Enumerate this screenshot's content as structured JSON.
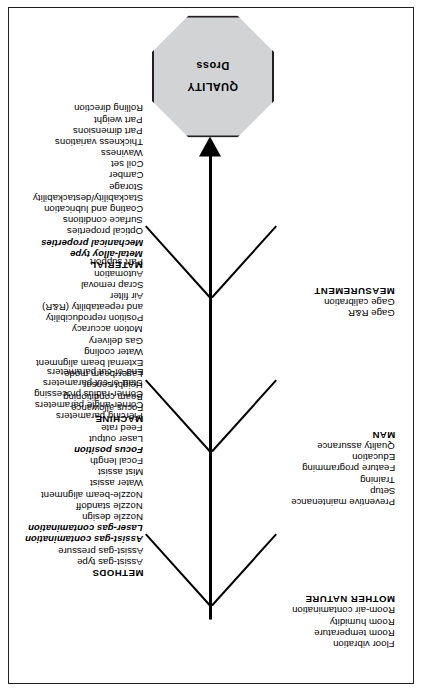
{
  "diagram": {
    "type": "fishbone-ishikawa",
    "orientation": "rotated-90-ccw",
    "effect": {
      "title": "QUALITY",
      "subtitle": "Dross",
      "shape": "octagon",
      "fill_color": "#d2d3d5",
      "border_color": "#231f20"
    },
    "categories": [
      {
        "name": "METHODS",
        "side": "lower",
        "items": [
          {
            "label": "METHODS",
            "style": "head"
          },
          {
            "label": "Assist-gas type",
            "style": "normal"
          },
          {
            "label": "Assist-gas pressure",
            "style": "normal"
          },
          {
            "label": "Assist-gas contamination",
            "style": "em"
          },
          {
            "label": "Laser-gas contamination",
            "style": "em"
          },
          {
            "label": "Nozzle design",
            "style": "normal"
          },
          {
            "label": "Nozzle standoff",
            "style": "normal"
          },
          {
            "label": "Nozzle-beam alignment",
            "style": "normal"
          },
          {
            "label": "Water assist",
            "style": "normal"
          },
          {
            "label": "Mist assist",
            "style": "normal"
          },
          {
            "label": "Focal length",
            "style": "normal"
          },
          {
            "label": "Focus position",
            "style": "em"
          },
          {
            "label": "Laser output",
            "style": "normal"
          },
          {
            "label": "Feed rate",
            "style": "normal"
          },
          {
            "label": "Piercing parameters",
            "style": "normal"
          },
          {
            "label": "Corner-angle parameters",
            "style": "normal"
          },
          {
            "label": "Corner-radius processing",
            "style": "normal"
          },
          {
            "label": "Start-of-cut parameters",
            "style": "normal"
          },
          {
            "label": "End-of-cut parameters",
            "style": "normal"
          }
        ]
      },
      {
        "name": "MOTHER NATURE",
        "side": "upper",
        "items": [
          {
            "label": "Floor vibration",
            "style": "normal"
          },
          {
            "label": "Room temperature",
            "style": "normal"
          },
          {
            "label": "Room humidity",
            "style": "normal"
          },
          {
            "label": "Room-air contamination",
            "style": "normal"
          },
          {
            "label": "MOTHER NATURE",
            "style": "head"
          }
        ]
      },
      {
        "name": "MACHINE",
        "side": "lower",
        "items": [
          {
            "label": "MACHINE",
            "style": "head"
          },
          {
            "label": "Focus allowance",
            "style": "normal"
          },
          {
            "label": "Beam conditioning",
            "style": "normal"
          },
          {
            "label": "Height sensor",
            "style": "normal"
          },
          {
            "label": "Laser-beam mode",
            "style": "normal"
          },
          {
            "label": "External beam alignment",
            "style": "normal"
          },
          {
            "label": "Water cooling",
            "style": "normal"
          },
          {
            "label": "Gas delivery",
            "style": "normal"
          },
          {
            "label": "Motion accuracy",
            "style": "normal"
          },
          {
            "label": "Position reproducibility",
            "style": "normal"
          },
          {
            "label": "and repeatability (R&R)",
            "style": "normal"
          },
          {
            "label": "Air filter",
            "style": "normal"
          },
          {
            "label": "Scrap removal",
            "style": "normal"
          },
          {
            "label": "Automation",
            "style": "normal"
          },
          {
            "label": "Part support",
            "style": "normal"
          }
        ]
      },
      {
        "name": "MAN",
        "side": "upper",
        "items": [
          {
            "label": "Preventive maintenance",
            "style": "normal"
          },
          {
            "label": "Setup",
            "style": "normal"
          },
          {
            "label": "Training",
            "style": "normal"
          },
          {
            "label": "Feature programming",
            "style": "normal"
          },
          {
            "label": "Education",
            "style": "normal"
          },
          {
            "label": "Quality assurance",
            "style": "normal"
          },
          {
            "label": "MAN",
            "style": "head"
          }
        ]
      },
      {
        "name": "MATERIAL",
        "side": "lower",
        "items": [
          {
            "label": "MATERIAL",
            "style": "head"
          },
          {
            "label": "Metal-alloy type",
            "style": "em"
          },
          {
            "label": "Mechanical properties",
            "style": "em"
          },
          {
            "label": "Optical properties",
            "style": "normal"
          },
          {
            "label": "Surface conditions",
            "style": "normal"
          },
          {
            "label": "Coating and lubrication",
            "style": "normal"
          },
          {
            "label": "Stackability/destackability",
            "style": "normal"
          },
          {
            "label": "Storage",
            "style": "normal"
          },
          {
            "label": "Camber",
            "style": "normal"
          },
          {
            "label": "Coil set",
            "style": "normal"
          },
          {
            "label": "Waviness",
            "style": "normal"
          },
          {
            "label": "Thickness variations",
            "style": "normal"
          },
          {
            "label": "Part dimensions",
            "style": "normal"
          },
          {
            "label": "Part weight",
            "style": "normal"
          },
          {
            "label": "Rolling direction",
            "style": "normal"
          }
        ]
      },
      {
        "name": "MEASUREMENT",
        "side": "upper",
        "items": [
          {
            "label": "Gage R&R",
            "style": "normal"
          },
          {
            "label": "Gage calibration",
            "style": "normal"
          },
          {
            "label": "MEASUREMENT",
            "style": "head"
          }
        ]
      }
    ]
  }
}
